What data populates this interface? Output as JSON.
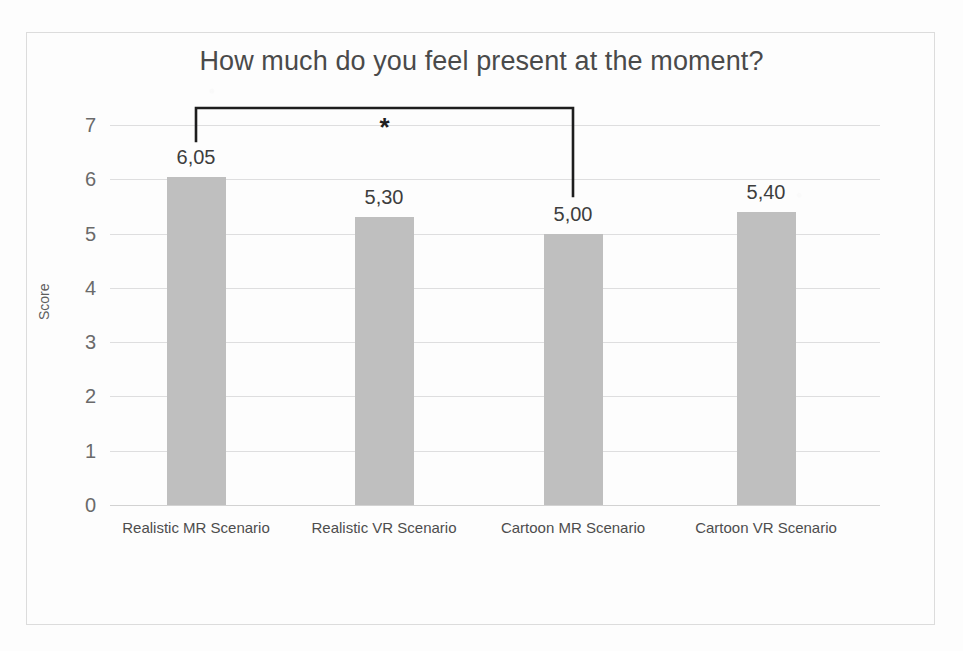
{
  "chart_data": {
    "type": "bar",
    "title": "How much do you feel present at the moment?",
    "xlabel": "",
    "ylabel": "Score",
    "ylim": [
      0,
      7
    ],
    "yticks": [
      "0",
      "1",
      "2",
      "3",
      "4",
      "5",
      "6",
      "7"
    ],
    "grid": true,
    "legend": "none",
    "categories": [
      "Realistic MR Scenario",
      "Realistic VR Scenario",
      "Cartoon MR Scenario",
      "Cartoon VR Scenario"
    ],
    "values": [
      6.05,
      5.3,
      5.0,
      5.4
    ],
    "value_labels": [
      "6,05",
      "5,30",
      "5,00",
      "5,40"
    ],
    "bar_color": "#bfbfbf",
    "annotations": [
      {
        "type": "significance-bracket",
        "label": "*",
        "from_category": "Realistic MR Scenario",
        "to_category": "Cartoon MR Scenario"
      }
    ]
  },
  "colors": {
    "bar": "#bfbfbf",
    "gridline": "#dededf",
    "title_text": "#4a4a4a",
    "tick_text": "#6a6a6a",
    "bracket": "#1e1e1e",
    "frame": "#dcdcdc"
  }
}
